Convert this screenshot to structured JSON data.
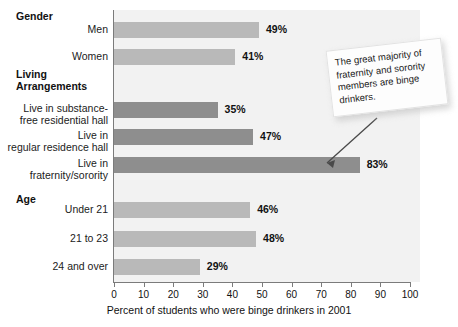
{
  "chart_data": {
    "type": "bar",
    "orientation": "horizontal",
    "title": "",
    "xlabel": "Percent of students who were binge drinkers in 2001",
    "ylabel": "",
    "xlim": [
      0,
      100
    ],
    "xticks": [
      0,
      10,
      20,
      30,
      40,
      50,
      60,
      70,
      80,
      90,
      100
    ],
    "grid": false,
    "legend": null,
    "groups": [
      {
        "header": "Gender",
        "rows": [
          {
            "label": "Men",
            "value": 49,
            "value_label": "49%",
            "shade": "light"
          },
          {
            "label": "Women",
            "value": 41,
            "value_label": "41%",
            "shade": "light"
          }
        ]
      },
      {
        "header": "Living\nArrangements",
        "rows": [
          {
            "label": "Live in substance-\nfree residential hall",
            "value": 35,
            "value_label": "35%",
            "shade": "dark"
          },
          {
            "label": "Live in\nregular residence hall",
            "value": 47,
            "value_label": "47%",
            "shade": "dark"
          },
          {
            "label": "Live in\nfraternity/sorority",
            "value": 83,
            "value_label": "83%",
            "shade": "dark"
          }
        ]
      },
      {
        "header": "Age",
        "rows": [
          {
            "label": "Under 21",
            "value": 46,
            "value_label": "46%",
            "shade": "light"
          },
          {
            "label": "21 to 23",
            "value": 48,
            "value_label": "48%",
            "shade": "light"
          },
          {
            "label": "24 and over",
            "value": 29,
            "value_label": "29%",
            "shade": "light"
          }
        ]
      }
    ],
    "categories": [
      "Men",
      "Women",
      "Live in substance-free residential hall",
      "Live in regular residence hall",
      "Live in fraternity/sorority",
      "Under 21",
      "21 to 23",
      "24 and over"
    ],
    "values": [
      49,
      41,
      35,
      47,
      83,
      46,
      48,
      29
    ],
    "colors": {
      "bar_light": "#b9b9b9",
      "bar_dark": "#8e8e8e",
      "plot_background": "#f2f2f2",
      "axis": "#7b7b7b",
      "text": "#111111"
    }
  },
  "callout": {
    "text": "The great majority of fraternity and sorority members are binge drinkers."
  }
}
